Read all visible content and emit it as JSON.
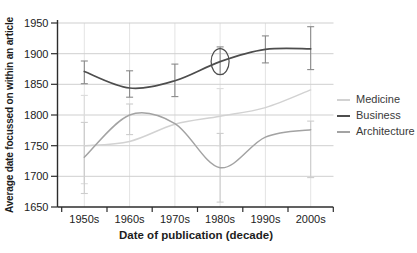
{
  "chart_data": {
    "type": "line",
    "title": "",
    "xlabel": "Date of publication (decade)",
    "ylabel": "Average date focussed on within an article",
    "categories": [
      "1950s",
      "1960s",
      "1970s",
      "1980s",
      "1990s",
      "2000s"
    ],
    "ylim": [
      1650,
      1950
    ],
    "yticks": [
      1650,
      1700,
      1750,
      1800,
      1850,
      1900,
      1950
    ],
    "grid": true,
    "legend_position": "right",
    "series": [
      {
        "name": "Medicine",
        "color": "#d2d2d2",
        "error_color": "#dcdcdc",
        "values": [
          1750,
          1757,
          1785,
          1798,
          1812,
          1841
        ],
        "error_bars": [
          [
            1688,
            1832
          ],
          null,
          null,
          [
            1750,
            1843
          ],
          null,
          null
        ]
      },
      {
        "name": "Business",
        "color": "#4d4d4d",
        "error_color": "#8a8a8a",
        "values": [
          1871,
          1844,
          1856,
          1887,
          1907,
          1908
        ],
        "error_bars": [
          [
            1851,
            1888
          ],
          [
            1829,
            1872
          ],
          [
            1830,
            1883
          ],
          [
            1866,
            1911
          ],
          [
            1885,
            1929
          ],
          [
            1874,
            1944
          ]
        ]
      },
      {
        "name": "Architecture",
        "color": "#a3a3a3",
        "error_color": "#cdcdcd",
        "values": [
          1731,
          1800,
          1786,
          1714,
          1764,
          1776
        ],
        "error_bars": [
          [
            1672,
            1788
          ],
          [
            1768,
            1818
          ],
          null,
          [
            1658,
            1770
          ],
          null,
          [
            1698,
            1790
          ]
        ]
      }
    ],
    "legend_order": [
      "Medicine",
      "Business",
      "Architecture"
    ],
    "annotations": [
      {
        "type": "ellipse",
        "series": "Business",
        "category": "1980s",
        "value": 1887,
        "note": "circled data point"
      }
    ]
  }
}
